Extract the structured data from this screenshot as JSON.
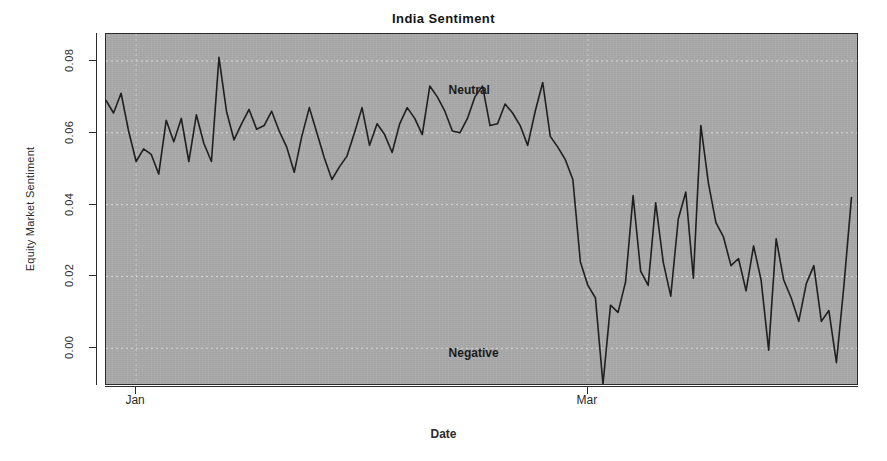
{
  "chart_data": {
    "type": "line",
    "title": "India Sentiment",
    "xlabel": "Date",
    "ylabel": "Equity Market Sentiment",
    "grid": true,
    "grid_style": "dashed-white",
    "legend": "none",
    "panel_background": "#a9a9a9",
    "line_color": "#1f1f1f",
    "ylim": [
      -0.0105,
      0.0875
    ],
    "yticks": [
      0.0,
      0.02,
      0.04,
      0.06,
      0.08
    ],
    "ytick_labels": [
      "0.00",
      "0.02",
      "0.04",
      "0.06",
      "0.08"
    ],
    "xticks": [
      4,
      64
    ],
    "xtick_labels": [
      "Jan",
      "Mar"
    ],
    "xlim": [
      0,
      100
    ],
    "annotations": [
      {
        "text": "Neutral",
        "x": 45.5,
        "y": 0.0715
      },
      {
        "text": "Negative",
        "x": 45.5,
        "y": -0.0015
      }
    ],
    "series": [
      {
        "name": "Equity Market Sentiment",
        "x": [
          0,
          1,
          2,
          3,
          4,
          5,
          6,
          7,
          8,
          9,
          10,
          11,
          12,
          13,
          14,
          15,
          16,
          17,
          18,
          19,
          20,
          21,
          22,
          23,
          24,
          25,
          26,
          27,
          28,
          29,
          30,
          31,
          32,
          33,
          34,
          35,
          36,
          37,
          38,
          39,
          40,
          41,
          42,
          43,
          44,
          45,
          46,
          47,
          48,
          49,
          50,
          51,
          52,
          53,
          54,
          55,
          56,
          57,
          58,
          59,
          60,
          61,
          62,
          63,
          64,
          65,
          66,
          67,
          68,
          69,
          70,
          71,
          72,
          73,
          74,
          75,
          76,
          77,
          78,
          79,
          80,
          81,
          82,
          83,
          84,
          85,
          86,
          87,
          88,
          89,
          90,
          91,
          92,
          93,
          94,
          95,
          96,
          97,
          98,
          99
        ],
        "values": [
          0.069,
          0.0655,
          0.071,
          0.0605,
          0.052,
          0.0555,
          0.054,
          0.0485,
          0.0635,
          0.0575,
          0.064,
          0.052,
          0.065,
          0.057,
          0.052,
          0.081,
          0.066,
          0.058,
          0.0625,
          0.0665,
          0.061,
          0.062,
          0.066,
          0.0605,
          0.056,
          0.049,
          0.059,
          0.067,
          0.06,
          0.053,
          0.047,
          0.0505,
          0.0535,
          0.06,
          0.067,
          0.0565,
          0.0625,
          0.0595,
          0.0545,
          0.0625,
          0.067,
          0.064,
          0.0595,
          0.073,
          0.07,
          0.066,
          0.0605,
          0.06,
          0.064,
          0.07,
          0.073,
          0.062,
          0.0625,
          0.068,
          0.0655,
          0.062,
          0.0565,
          0.066,
          0.074,
          0.059,
          0.056,
          0.0525,
          0.047,
          0.024,
          0.0175,
          0.014,
          -0.01,
          0.012,
          0.01,
          0.0185,
          0.0425,
          0.0215,
          0.0175,
          0.0405,
          0.024,
          0.0145,
          0.036,
          0.0435,
          0.0195,
          0.062,
          0.046,
          0.035,
          0.031,
          0.023,
          0.025,
          0.016,
          0.0285,
          0.019,
          -0.0005,
          0.0305,
          0.019,
          0.014,
          0.0075,
          0.018,
          0.023,
          0.0075,
          0.0105,
          -0.004,
          0.0175,
          0.042
        ]
      }
    ]
  }
}
